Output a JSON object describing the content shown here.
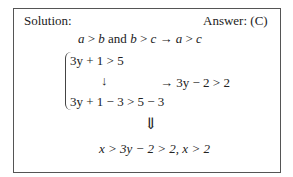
{
  "solution_label": "Solution:",
  "answer_label": "Answer: (C)",
  "line1": {
    "a": "a",
    "gt1": " > ",
    "b": "b",
    "and": " and ",
    "b2": "b",
    "gt2": " > ",
    "c": "c",
    "arrow": " → ",
    "a2": "a",
    "gt3": " > ",
    "c2": "c"
  },
  "system": {
    "eq1": "3y + 1 > 5",
    "down_arrow": "↓",
    "eq2": "3y + 1 − 3 > 5 − 3",
    "result": "→ 3y − 2 > 2"
  },
  "implies": "⇓",
  "conclusion": "x > 3y − 2 > 2,  x > 2"
}
